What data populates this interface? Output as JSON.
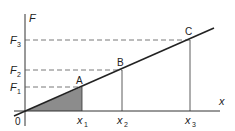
{
  "diagram": {
    "type": "force-extension graph",
    "axes": {
      "y_label": "F",
      "x_label": "x",
      "origin_label": "0"
    },
    "points": [
      {
        "label": "A",
        "x_label": "x",
        "x_sub": "1",
        "y_label": "F",
        "y_sub": "1"
      },
      {
        "label": "B",
        "x_label": "x",
        "x_sub": "2",
        "y_label": "F",
        "y_sub": "2"
      },
      {
        "label": "C",
        "x_label": "x",
        "x_sub": "3",
        "y_label": "F",
        "y_sub": "3"
      }
    ],
    "shaded_region": "triangle under line from 0 to A",
    "colors": {
      "line": "#222222",
      "shade": "#8c8c8c",
      "dashed": "#555555",
      "axis": "#333333"
    }
  }
}
